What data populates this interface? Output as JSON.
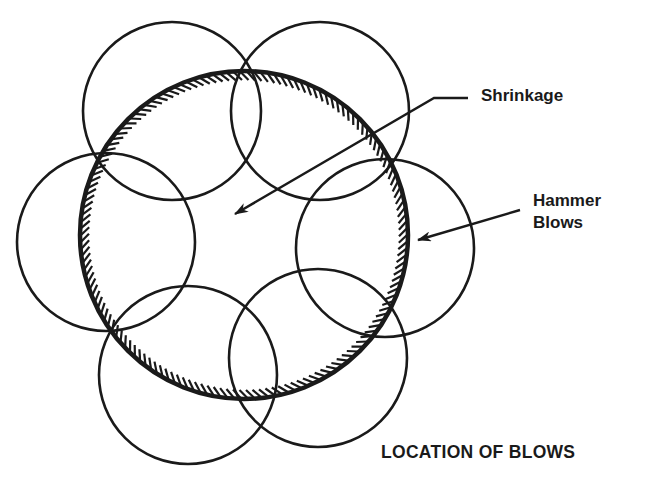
{
  "diagram": {
    "title": "LOCATION OF BLOWS",
    "labels": {
      "shrinkage": "Shrinkage",
      "hammer_line1": "Hammer",
      "hammer_line2": "Blows"
    },
    "colors": {
      "ink": "#1a1a1a",
      "background": "#ffffff"
    },
    "main_circle": {
      "cx": 244,
      "cy": 235,
      "r": 164,
      "hatched": "inside"
    },
    "blow_circles": [
      {
        "name": "top-left",
        "cx": 172,
        "cy": 111,
        "r": 89
      },
      {
        "name": "top-right",
        "cx": 320,
        "cy": 111,
        "r": 89
      },
      {
        "name": "left",
        "cx": 106,
        "cy": 242,
        "r": 89
      },
      {
        "name": "right",
        "cx": 385,
        "cy": 248,
        "r": 89
      },
      {
        "name": "bottom-left",
        "cx": 188,
        "cy": 375,
        "r": 89
      },
      {
        "name": "bottom-right",
        "cx": 318,
        "cy": 358,
        "r": 89
      }
    ],
    "arrows": [
      {
        "name": "shrinkage-arrow",
        "points": [
          [
            468,
            98
          ],
          [
            434,
            98
          ],
          [
            235,
            214
          ]
        ]
      },
      {
        "name": "hammer-blows-arrow",
        "points": [
          [
            520,
            210
          ],
          [
            418,
            240
          ]
        ]
      }
    ]
  }
}
